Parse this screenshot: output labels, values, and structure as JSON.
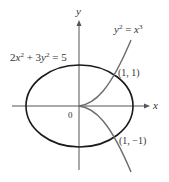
{
  "figure": {
    "axes": {
      "x_label": "x",
      "y_label": "y",
      "origin_label": "0"
    },
    "curves": [
      {
        "name": "ellipse",
        "equation": "2x² + 3y² = 5",
        "color": "#1a1a1a"
      },
      {
        "name": "semicubical-parabola",
        "equation": "y² = x³",
        "color": "#6b6b6b"
      }
    ],
    "labels": {
      "ellipse_eq": {
        "a": "2",
        "x": "x",
        "p1": "2",
        "plus": " + 3",
        "y": "y",
        "p2": "2",
        "rhs": " = 5"
      },
      "cusp_eq": {
        "y": "y",
        "p1": "2",
        "eq": " = ",
        "x": "x",
        "p2": "3"
      }
    },
    "points": [
      {
        "label": "(1, 1)",
        "x": 1,
        "y": 1
      },
      {
        "label": "(1, −1)",
        "x": 1,
        "y": -1
      }
    ],
    "colors": {
      "axis": "#555555",
      "ellipse": "#1a1a1a",
      "cusp": "#6b6b6b",
      "text": "#333333"
    }
  }
}
